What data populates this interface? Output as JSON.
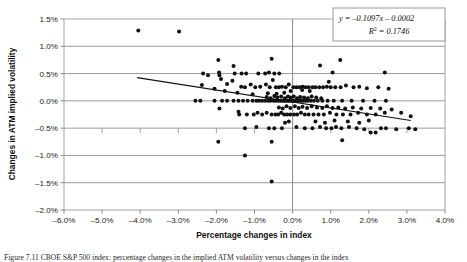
{
  "figure": {
    "caption": "Figure 7.11   CBOE S&P 500 index: percentage changes in the implied ATM volatility versus changes in the index"
  },
  "chart_data": {
    "type": "scatter",
    "title": "",
    "xlabel": "Percentage changes in index",
    "ylabel": "Changes in ATM implied volatility",
    "xlim": [
      -6.0,
      4.0
    ],
    "ylim": [
      -2.0,
      1.5
    ],
    "xticks": [
      -6.0,
      -5.0,
      -4.0,
      -3.0,
      -2.0,
      -1.0,
      0.0,
      1.0,
      2.0,
      3.0,
      4.0
    ],
    "yticks": [
      1.5,
      1.0,
      0.5,
      0.0,
      -0.5,
      -1.0,
      -1.5,
      -2.0
    ],
    "xtick_labels": [
      "-6.0%",
      "-5.0%",
      "-4.0%",
      "-3.0%",
      "-2.0%",
      "-1.0%",
      "0.0%",
      "1.0%",
      "2.0%",
      "3.0%",
      "4.0%"
    ],
    "ytick_labels": [
      "1.5%",
      "1.0%",
      "0.5%",
      "0.0%",
      "-0.5%",
      "-1.0%",
      "-1.5%",
      "-2.0%"
    ],
    "grid": "horizontal",
    "legend_position": "none",
    "marker": {
      "shape": "circle",
      "color": "#111111",
      "size": 2.0
    },
    "trendline": {
      "equation_text": "y = –0.1097x – 0.0002",
      "r2_text": "R² = 0.1746",
      "slope": -0.1097,
      "intercept": -0.0002,
      "r_squared": 0.1746,
      "x_start": -4.08,
      "x_end": 3.1,
      "color": "#111111"
    },
    "annotation_box": {
      "line1": "y = –0.1097x – 0.0002",
      "line2_prefix": "R",
      "line2_sup": "2",
      "line2_rest": " = 0.1746"
    },
    "points": [
      [
        -4.05,
        1.29
      ],
      [
        -2.98,
        1.27
      ],
      [
        -1.95,
        0.75
      ],
      [
        -0.55,
        0.77
      ],
      [
        1.25,
        0.75
      ],
      [
        -1.55,
        0.64
      ],
      [
        0.72,
        0.65
      ],
      [
        -2.35,
        0.5
      ],
      [
        -2.22,
        0.47
      ],
      [
        -1.93,
        0.52
      ],
      [
        -1.92,
        0.47
      ],
      [
        -1.52,
        0.5
      ],
      [
        -1.34,
        0.5
      ],
      [
        -1.22,
        0.5
      ],
      [
        -0.9,
        0.5
      ],
      [
        -0.72,
        0.5
      ],
      [
        -0.62,
        0.52
      ],
      [
        -0.48,
        0.5
      ],
      [
        -0.35,
        0.5
      ],
      [
        1.05,
        0.52
      ],
      [
        2.42,
        0.52
      ],
      [
        -2.38,
        0.29
      ],
      [
        -1.88,
        0.4
      ],
      [
        -1.72,
        0.31
      ],
      [
        -1.58,
        0.37
      ],
      [
        -1.35,
        0.26
      ],
      [
        -1.25,
        0.25
      ],
      [
        -1.1,
        0.3
      ],
      [
        -0.98,
        0.25
      ],
      [
        -0.85,
        0.26
      ],
      [
        -0.7,
        0.3
      ],
      [
        -0.6,
        0.25
      ],
      [
        -0.52,
        0.38
      ],
      [
        -0.44,
        0.25
      ],
      [
        -0.36,
        0.25
      ],
      [
        -0.28,
        0.26
      ],
      [
        -0.18,
        0.25
      ],
      [
        -0.1,
        0.3
      ],
      [
        0.02,
        0.25
      ],
      [
        0.1,
        0.25
      ],
      [
        0.18,
        0.25
      ],
      [
        0.26,
        0.26
      ],
      [
        0.34,
        0.25
      ],
      [
        0.42,
        0.25
      ],
      [
        0.52,
        0.25
      ],
      [
        0.6,
        0.25
      ],
      [
        0.7,
        0.25
      ],
      [
        0.8,
        0.25
      ],
      [
        0.9,
        0.26
      ],
      [
        1.0,
        0.25
      ],
      [
        1.12,
        0.25
      ],
      [
        1.26,
        0.25
      ],
      [
        1.4,
        0.28
      ],
      [
        1.6,
        0.25
      ],
      [
        1.75,
        0.26
      ],
      [
        1.95,
        0.23
      ],
      [
        2.25,
        0.25
      ],
      [
        2.52,
        0.22
      ],
      [
        0.95,
        0.35
      ],
      [
        0.45,
        0.18
      ],
      [
        0.25,
        0.2
      ],
      [
        -0.05,
        0.18
      ],
      [
        -0.22,
        0.15
      ],
      [
        -0.42,
        0.13
      ],
      [
        -0.65,
        0.14
      ],
      [
        -1.05,
        0.12
      ],
      [
        -1.45,
        0.15
      ],
      [
        -1.78,
        0.18
      ],
      [
        -2.05,
        0.22
      ],
      [
        -2.55,
        0.0
      ],
      [
        -2.42,
        0.0
      ],
      [
        -2.05,
        0.0
      ],
      [
        -1.85,
        0.0
      ],
      [
        -1.72,
        0.0
      ],
      [
        -1.55,
        0.0
      ],
      [
        -1.42,
        0.0
      ],
      [
        -1.3,
        0.0
      ],
      [
        -1.18,
        0.0
      ],
      [
        -1.05,
        0.0
      ],
      [
        -0.95,
        0.0
      ],
      [
        -0.88,
        0.0
      ],
      [
        -0.8,
        0.0
      ],
      [
        -0.72,
        0.0
      ],
      [
        -0.64,
        0.0
      ],
      [
        -0.58,
        0.0
      ],
      [
        -0.5,
        0.0
      ],
      [
        -0.44,
        0.0
      ],
      [
        -0.38,
        0.0
      ],
      [
        -0.32,
        0.0
      ],
      [
        -0.27,
        0.0
      ],
      [
        -0.22,
        0.0
      ],
      [
        -0.18,
        0.0
      ],
      [
        -0.14,
        0.0
      ],
      [
        -0.1,
        0.0
      ],
      [
        -0.06,
        0.0
      ],
      [
        -0.02,
        0.0
      ],
      [
        0.02,
        0.0
      ],
      [
        0.06,
        0.0
      ],
      [
        0.1,
        0.0
      ],
      [
        0.14,
        0.0
      ],
      [
        0.18,
        0.0
      ],
      [
        0.23,
        0.0
      ],
      [
        0.28,
        0.0
      ],
      [
        0.34,
        0.0
      ],
      [
        0.4,
        0.0
      ],
      [
        0.48,
        0.0
      ],
      [
        0.56,
        0.0
      ],
      [
        0.66,
        0.0
      ],
      [
        0.78,
        0.0
      ],
      [
        0.92,
        0.0
      ],
      [
        1.08,
        0.0
      ],
      [
        1.3,
        0.0
      ],
      [
        1.55,
        0.0
      ],
      [
        1.85,
        0.0
      ],
      [
        2.15,
        0.0
      ],
      [
        2.45,
        0.0
      ],
      [
        -0.4,
        0.06
      ],
      [
        -0.3,
        0.08
      ],
      [
        -0.2,
        0.05
      ],
      [
        -0.12,
        0.08
      ],
      [
        -0.05,
        0.06
      ],
      [
        0.03,
        0.08
      ],
      [
        0.12,
        0.05
      ],
      [
        0.2,
        0.07
      ],
      [
        0.3,
        0.06
      ],
      [
        0.4,
        0.05
      ],
      [
        0.5,
        0.08
      ],
      [
        0.62,
        0.06
      ],
      [
        0.75,
        0.05
      ],
      [
        -0.48,
        0.09
      ],
      [
        -0.58,
        0.05
      ],
      [
        -0.68,
        0.07
      ],
      [
        -1.92,
        -0.14
      ],
      [
        -1.42,
        -0.2
      ],
      [
        -1.4,
        -0.25
      ],
      [
        -1.2,
        -0.25
      ],
      [
        -1.02,
        -0.25
      ],
      [
        -0.92,
        -0.22
      ],
      [
        -0.8,
        -0.25
      ],
      [
        -0.68,
        -0.22
      ],
      [
        -0.55,
        -0.25
      ],
      [
        -0.45,
        -0.25
      ],
      [
        -0.38,
        -0.25
      ],
      [
        -0.3,
        -0.22
      ],
      [
        -0.22,
        -0.25
      ],
      [
        -0.14,
        -0.25
      ],
      [
        -0.06,
        -0.25
      ],
      [
        0.04,
        -0.25
      ],
      [
        0.12,
        -0.25
      ],
      [
        0.22,
        -0.22
      ],
      [
        0.32,
        -0.25
      ],
      [
        0.42,
        -0.25
      ],
      [
        0.55,
        -0.25
      ],
      [
        0.68,
        -0.25
      ],
      [
        0.82,
        -0.25
      ],
      [
        0.98,
        -0.22
      ],
      [
        1.15,
        -0.25
      ],
      [
        1.32,
        -0.25
      ],
      [
        1.52,
        -0.25
      ],
      [
        1.72,
        -0.22
      ],
      [
        1.95,
        -0.25
      ],
      [
        2.18,
        -0.25
      ],
      [
        2.42,
        -0.22
      ],
      [
        -0.36,
        -0.12
      ],
      [
        -0.26,
        -0.14
      ],
      [
        -0.16,
        -0.1
      ],
      [
        -0.06,
        -0.13
      ],
      [
        0.06,
        -0.1
      ],
      [
        0.16,
        -0.13
      ],
      [
        0.26,
        -0.11
      ],
      [
        0.38,
        -0.13
      ],
      [
        0.5,
        -0.1
      ],
      [
        0.64,
        -0.12
      ],
      [
        0.78,
        -0.13
      ],
      [
        0.9,
        -0.1
      ],
      [
        1.05,
        -0.13
      ],
      [
        1.2,
        -0.12
      ],
      [
        1.38,
        -0.14
      ],
      [
        1.58,
        -0.12
      ],
      [
        1.8,
        -0.14
      ],
      [
        2.05,
        -0.13
      ],
      [
        2.3,
        -0.14
      ],
      [
        2.6,
        -0.16
      ],
      [
        2.85,
        -0.22
      ],
      [
        3.1,
        -0.28
      ],
      [
        -1.25,
        -0.5
      ],
      [
        -0.95,
        -0.48
      ],
      [
        -0.62,
        -0.5
      ],
      [
        -0.48,
        -0.5
      ],
      [
        -0.28,
        -0.5
      ],
      [
        0.1,
        -0.48
      ],
      [
        0.32,
        -0.5
      ],
      [
        0.52,
        -0.5
      ],
      [
        0.72,
        -0.48
      ],
      [
        0.88,
        -0.5
      ],
      [
        1.02,
        -0.5
      ],
      [
        1.14,
        -0.48
      ],
      [
        1.28,
        -0.5
      ],
      [
        1.48,
        -0.48
      ],
      [
        1.68,
        -0.5
      ],
      [
        1.88,
        -0.52
      ],
      [
        2.05,
        -0.58
      ],
      [
        2.18,
        -0.58
      ],
      [
        2.32,
        -0.5
      ],
      [
        2.45,
        -0.5
      ],
      [
        2.72,
        -0.52
      ],
      [
        3.22,
        -0.52
      ],
      [
        3.05,
        -0.5
      ],
      [
        0.6,
        -0.38
      ],
      [
        0.85,
        -0.4
      ],
      [
        1.1,
        -0.36
      ],
      [
        1.45,
        -0.38
      ],
      [
        1.75,
        -0.4
      ],
      [
        2.0,
        -0.36
      ],
      [
        -0.1,
        -0.38
      ],
      [
        -0.2,
        -0.4
      ],
      [
        -1.95,
        -0.75
      ],
      [
        -0.55,
        -0.75
      ],
      [
        1.3,
        -0.72
      ],
      [
        -1.25,
        -1.0
      ],
      [
        -0.55,
        -1.48
      ]
    ]
  }
}
